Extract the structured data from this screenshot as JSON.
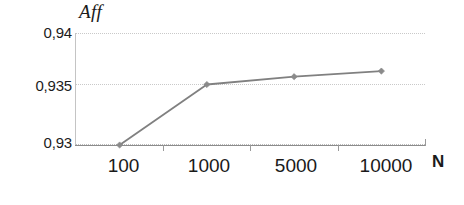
{
  "chart_data": {
    "type": "line",
    "title": "",
    "subtitle": "",
    "xlabel": "N",
    "ylabel": "Aff",
    "categories": [
      "100",
      "1000",
      "5000",
      "10000"
    ],
    "x_numeric": [
      100,
      1000,
      5000,
      10000
    ],
    "series": [
      {
        "name": "Aff",
        "values": [
          0.93,
          0.9354,
          0.9361,
          0.9366
        ],
        "value_labels": [
          "0,930",
          "0,9354",
          "0,9361",
          "0,9366"
        ],
        "line_color": "#808080",
        "marker": "diamond",
        "marker_color": "#8a8a8a"
      }
    ],
    "ylim": [
      0.93,
      0.94
    ],
    "y_ticks": [
      0.94,
      0.935,
      0.93
    ],
    "y_tick_labels": [
      "0,94",
      "0,935",
      "0,93"
    ],
    "x_tick_labels": [
      "100",
      "1000",
      "5000",
      "10000"
    ],
    "grid": "horizontal-dotted",
    "legend": "none",
    "decimal_separator": ",",
    "axis_color": "#8c8c8c",
    "grid_color": "#c9c9c9",
    "background": "#ffffff"
  }
}
